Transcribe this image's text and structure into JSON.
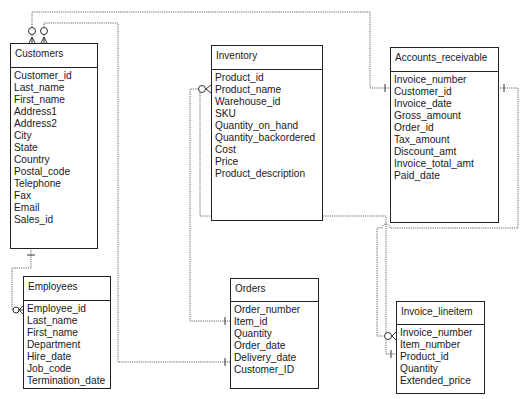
{
  "diagram": {
    "type": "entity-relationship",
    "entities": [
      {
        "id": "customers",
        "title": "Customers",
        "fields": [
          "Customer_id",
          "Last_name",
          "First_name",
          "Address1",
          "Address2",
          "City",
          "State",
          "Country",
          "Postal_code",
          "Telephone",
          "Fax",
          "Email",
          "Sales_id"
        ]
      },
      {
        "id": "employees",
        "title": "Employees",
        "fields": [
          "Employee_id",
          "Last_name",
          "First_name",
          "Department",
          "Hire_date",
          "Job_code",
          "Termination_date"
        ]
      },
      {
        "id": "inventory",
        "title": "Inventory",
        "fields": [
          "Product_id",
          "Product_name",
          "Warehouse_id",
          "SKU",
          "Quantity_on_hand",
          "Quantity_backordered",
          "Cost",
          "Price",
          "Product_description"
        ]
      },
      {
        "id": "orders",
        "title": "Orders",
        "fields": [
          "Order_number",
          "Item_id",
          "Quantity",
          "Order_date",
          "Delivery_date",
          "Customer_ID"
        ]
      },
      {
        "id": "accounts_receivable",
        "title": "Accounts_receivable",
        "fields": [
          "Invoice_number",
          "Customer_id",
          "Invoice_date",
          "Gross_amount",
          "Order_id",
          "Tax_amount",
          "Discount_amt",
          "Invoice_total_amt",
          "Paid_date"
        ]
      },
      {
        "id": "invoice_lineitem",
        "title": "Invoice_lineitem",
        "fields": [
          "Invoice_number",
          "Item_number",
          "Product_id",
          "Quantity",
          "Extended_price"
        ]
      }
    ],
    "relationships": [
      {
        "from": "Customers",
        "from_end": "zero-or-many",
        "to": "Accounts_receivable.Customer_id",
        "to_end": "one"
      },
      {
        "from": "Customers",
        "from_end": "zero-or-many",
        "to": "Orders.Customer_ID",
        "to_end": "one"
      },
      {
        "from": "Customers.Sales_id",
        "from_end": "one",
        "to": "Employees.Employee_id",
        "to_end": "zero-or-many"
      },
      {
        "from": "Inventory.Product_name",
        "from_end": "zero-or-many",
        "to": "Orders.Item_id",
        "to_end": "one"
      },
      {
        "from": "Inventory.Product_name",
        "from_end": "zero-or-many",
        "to": "Invoice_lineitem.Product_id",
        "to_end": "one"
      },
      {
        "from": "Accounts_receivable.Customer_id",
        "from_end": "one",
        "to": "Invoice_lineitem.Invoice_number",
        "to_end": "zero-or-many"
      }
    ],
    "colors": {
      "box_border": "#222222",
      "connector": "#555555",
      "background": "#ffffff"
    }
  }
}
